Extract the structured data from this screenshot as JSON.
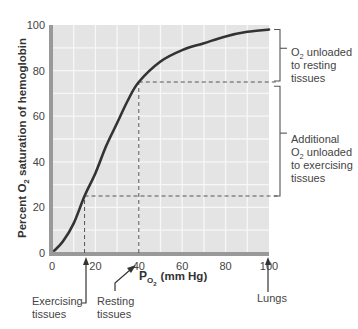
{
  "chart_data": {
    "type": "line",
    "title": "",
    "xlabel": "PO2 (mm Hg)",
    "xlabel_main": "P",
    "xlabel_sub": "O",
    "xlabel_subsub": "2",
    "xlabel_rest": "(mm Hg)",
    "ylabel": "Percent O2 saturation of hemoglobin",
    "ylabel_pre": "Percent O",
    "ylabel_sub": "2",
    "ylabel_post": " saturation of hemoglobin",
    "xlim": [
      0,
      100
    ],
    "ylim": [
      0,
      100
    ],
    "xticks": [
      0,
      20,
      40,
      60,
      80,
      100
    ],
    "yticks": [
      0,
      20,
      40,
      60,
      80,
      100
    ],
    "grid": true,
    "grid_step": 10,
    "series": [
      {
        "name": "Oxygen-hemoglobin dissociation curve",
        "x": [
          1,
          5,
          10,
          15,
          20,
          25,
          30,
          35,
          40,
          50,
          60,
          70,
          80,
          90,
          100
        ],
        "y": [
          1,
          5,
          13,
          25,
          35,
          47,
          57,
          67,
          75,
          84,
          89,
          92,
          95,
          97,
          98
        ]
      }
    ],
    "reference_lines": [
      {
        "type": "vertical",
        "x": 15,
        "y_to": 25
      },
      {
        "type": "vertical",
        "x": 40,
        "y_to": 75
      },
      {
        "type": "horizontal",
        "y": 25,
        "x_from": 15,
        "x_to": 100
      },
      {
        "type": "horizontal",
        "y": 75,
        "x_from": 40,
        "x_to": 100
      }
    ],
    "brackets": [
      {
        "from": 75,
        "to": 98,
        "label_lines": [
          "O2 unloaded",
          "to resting",
          "tissues"
        ]
      },
      {
        "from": 25,
        "to": 74,
        "label_lines": [
          "Additional",
          "O2 unloaded",
          "to exercising",
          "tissues"
        ]
      }
    ],
    "annotations": [
      {
        "text": "Exercising tissues",
        "x": 15
      },
      {
        "text": "Resting tissues",
        "x": 40
      },
      {
        "text": "Lungs",
        "x": 100
      }
    ]
  },
  "labels": {
    "bracket1": {
      "line1_pre": "O",
      "line1_sub": "2",
      "line1_post": " unloaded",
      "line2": "to resting",
      "line3": "tissues"
    },
    "bracket2": {
      "line1": "Additional",
      "line2_pre": "O",
      "line2_sub": "2",
      "line2_post": " unloaded",
      "line3": "to exercising",
      "line4": "tissues"
    },
    "exercising": {
      "line1": "Exercising",
      "line2": "tissues"
    },
    "resting": {
      "line1": "Resting",
      "line2": "tissues"
    },
    "lungs": "Lungs"
  },
  "colors": {
    "plot_bg": "#e4e4e4",
    "grid": "#f7f7f7",
    "curve": "#333333",
    "axis": "#999999",
    "dash": "#555555"
  }
}
